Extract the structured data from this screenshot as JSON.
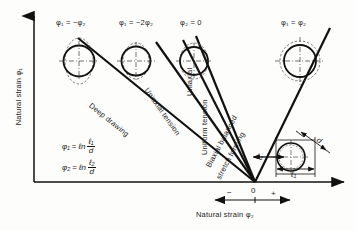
{
  "diagram": {
    "axes": {
      "y_label": "Natural strain φ₁",
      "x_label": "Natural strain φ₂",
      "origin_label": "0",
      "negative_sign": "−",
      "positive_sign": "+"
    },
    "strain_path_labels": [
      {
        "name": "deep-drawing",
        "text": "Deep drawing"
      },
      {
        "name": "uniaxial-tension",
        "text": "Uniaxial tension"
      },
      {
        "name": "uniaxial",
        "text": "Uniaxial"
      },
      {
        "name": "uniform-tension",
        "text": "Uniform tension"
      },
      {
        "name": "biaxial-balanced-line1",
        "text": "Biaxial balanced"
      },
      {
        "name": "biaxial-balanced-line2",
        "text": "stretch forming"
      }
    ],
    "circle_annotations": [
      {
        "name": "phi1-eq-minus-phi2",
        "text": "φ₁ = −φ₂"
      },
      {
        "name": "phi1-eq-minus-2phi2",
        "text": "φ₁ = −2φ₂"
      },
      {
        "name": "phi2-eq-zero",
        "text": "φ₂ = 0"
      },
      {
        "name": "phi1-eq-phi2",
        "text": "φ₁ = φ₂"
      }
    ],
    "formulas": [
      {
        "name": "phi1-formula",
        "lhs": "φ₁",
        "eq": "=",
        "op": "ℓn",
        "num": "ℓ₁",
        "den": "d"
      },
      {
        "name": "phi2-formula",
        "lhs": "φ₂",
        "eq": "=",
        "op": "ℓn",
        "num": "ℓ₂",
        "den": "d"
      }
    ],
    "inset": {
      "name": "deformed-grid-circle-inset",
      "diagonal_label": "d",
      "vertical_label": "ℓ₂",
      "horizontal_label": "ℓ₁"
    },
    "colors": {
      "ink": "#111111",
      "paper": "#fdfdfc",
      "dashed": "#444444"
    }
  }
}
